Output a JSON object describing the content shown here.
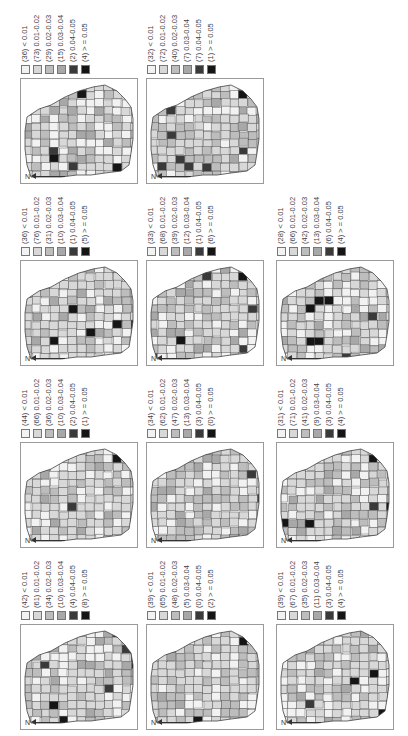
{
  "figure": {
    "classes": [
      "< 0.01",
      "0.01-0.02",
      "0.02-0.03",
      "0.03-0.04",
      "0.04-0.05",
      "> = 0.05"
    ],
    "class_colors": [
      "#f2f2f2",
      "#d8d8d8",
      "#bdbdbd",
      "#a8a8a8",
      "#3a3a3a",
      "#151515"
    ],
    "north_label": "N"
  },
  "chart_data": {
    "type": "choropleth-map-grid",
    "title": "",
    "legend_classes": [
      "< 0.01",
      "0.01-0.02",
      "0.02-0.03",
      "0.03-0.04",
      "0.04-0.05",
      "> = 0.05"
    ],
    "panels": [
      {
        "row": 1,
        "col": 1,
        "counts": [
          36,
          73,
          29,
          15,
          2,
          4
        ]
      },
      {
        "row": 1,
        "col": 2,
        "counts": [
          32,
          72,
          40,
          7,
          7,
          1
        ]
      },
      {
        "row": 2,
        "col": 1,
        "counts": [
          36,
          76,
          31,
          10,
          1,
          5
        ]
      },
      {
        "row": 2,
        "col": 2,
        "counts": [
          33,
          68,
          39,
          12,
          1,
          6
        ]
      },
      {
        "row": 2,
        "col": 3,
        "counts": [
          28,
          66,
          42,
          13,
          6,
          4
        ]
      },
      {
        "row": 3,
        "col": 1,
        "counts": [
          44,
          66,
          36,
          10,
          2,
          1
        ]
      },
      {
        "row": 3,
        "col": 2,
        "counts": [
          34,
          62,
          47,
          13,
          3,
          0
        ]
      },
      {
        "row": 3,
        "col": 3,
        "counts": [
          31,
          71,
          41,
          9,
          3,
          4
        ]
      },
      {
        "row": 4,
        "col": 1,
        "counts": [
          42,
          61,
          34,
          10,
          4,
          8
        ]
      },
      {
        "row": 4,
        "col": 2,
        "counts": [
          39,
          65,
          48,
          5,
          0,
          2
        ]
      },
      {
        "row": 4,
        "col": 3,
        "counts": [
          39,
          67,
          35,
          11,
          3,
          4
        ]
      }
    ]
  },
  "panels": [
    {
      "labels": [
        "(36) < 0.01",
        "(73) 0.01-0.02",
        "(29) 0.02-0.03",
        "(15) 0.03-0.04",
        "(2) 0.04-0.05",
        "(4) > = 0.05"
      ]
    },
    {
      "labels": [
        "(32) < 0.01",
        "(72) 0.01-0.02",
        "(40) 0.02-0.03",
        "(7) 0.03-0.04",
        "(7) 0.04-0.05",
        "(1) > = 0.05"
      ]
    },
    {
      "labels": [
        "(36) < 0.01",
        "(76) 0.01-0.02",
        "(31) 0.02-0.03",
        "(10) 0.03-0.04",
        "(1) 0.04-0.05",
        "(5) > = 0.05"
      ]
    },
    {
      "labels": [
        "(33) < 0.01",
        "(68) 0.01-0.02",
        "(39) 0.02-0.03",
        "(12) 0.03-0.04",
        "(1) 0.04-0.05",
        "(6) > = 0.05"
      ]
    },
    {
      "labels": [
        "(28) < 0.01",
        "(66) 0.01-0.02",
        "(42) 0.02-0.03",
        "(13) 0.03-0.04",
        "(6) 0.04-0.05",
        "(4) > = 0.05"
      ]
    },
    {
      "labels": [
        "(44) < 0.01",
        "(66) 0.01-0.02",
        "(36) 0.02-0.03",
        "(10) 0.03-0.04",
        "(2) 0.04-0.05",
        "(1) > = 0.05"
      ]
    },
    {
      "labels": [
        "(34) < 0.01",
        "(62) 0.01-0.02",
        "(47) 0.02-0.03",
        "(13) 0.03-0.04",
        "(3) 0.04-0.05",
        "(0) > = 0.05"
      ]
    },
    {
      "labels": [
        "(31) < 0.01",
        "(71) 0.01-0.02",
        "(41) 0.02-0.03",
        "(9) 0.03-0.04",
        "(3) 0.04-0.05",
        "(4) > = 0.05"
      ]
    },
    {
      "labels": [
        "(42) < 0.01",
        "(61) 0.01-0.02",
        "(34) 0.02-0.03",
        "(10) 0.03-0.04",
        "(4) 0.04-0.05",
        "(8) > = 0.05"
      ]
    },
    {
      "labels": [
        "(39) < 0.01",
        "(65) 0.01-0.02",
        "(48) 0.02-0.03",
        "(5) 0.03-0.04",
        "(0) 0.04-0.05",
        "(2) > = 0.05"
      ]
    },
    {
      "labels": [
        "(39) < 0.01",
        "(67) 0.01-0.02",
        "(35) 0.02-0.03",
        "(11) 0.03-0.04",
        "(3) 0.04-0.05",
        "(4) > = 0.05"
      ]
    }
  ]
}
